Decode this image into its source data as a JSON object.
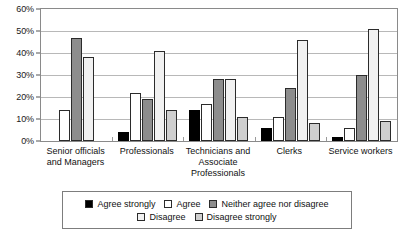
{
  "chart_data": {
    "type": "bar",
    "title": "",
    "subtitle": "",
    "xlabel": "",
    "ylabel": "",
    "ylim": [
      0,
      60
    ],
    "ytick_labels": [
      "0%",
      "10%",
      "20%",
      "30%",
      "40%",
      "50%",
      "60%"
    ],
    "ytick_values": [
      0,
      10,
      20,
      30,
      40,
      50,
      60
    ],
    "grid": true,
    "legend_position": "bottom",
    "categories": [
      "Senior officials and Managers",
      "Professionals",
      "Technicians and Associate Professionals",
      "Clerks",
      "Service workers"
    ],
    "series": [
      {
        "name": "Agree strongly",
        "color": "#000000",
        "values": [
          0,
          4,
          14,
          6,
          2
        ]
      },
      {
        "name": "Agree",
        "color": "#ffffff",
        "values": [
          14,
          22,
          17,
          11,
          6
        ]
      },
      {
        "name": "Neither agree nor disagree",
        "color": "#8d8d8d",
        "values": [
          47,
          19,
          28,
          24,
          30
        ]
      },
      {
        "name": "Disagree",
        "color": "#f1f1f1",
        "values": [
          38,
          41,
          28,
          46,
          51
        ]
      },
      {
        "name": "Disagree strongly",
        "color": "#cfcfcf",
        "values": [
          0,
          14,
          11,
          8,
          9
        ]
      }
    ]
  },
  "axis": {
    "y_ticks": [
      {
        "label": "60%",
        "value": 60
      },
      {
        "label": "50%",
        "value": 50
      },
      {
        "label": "40%",
        "value": 40
      },
      {
        "label": "30%",
        "value": 30
      },
      {
        "label": "20%",
        "value": 20
      },
      {
        "label": "10%",
        "value": 10
      },
      {
        "label": "0%",
        "value": 0
      }
    ],
    "x_labels": [
      "Senior officials and Managers",
      "Professionals",
      "Technicians and Associate Professionals",
      "Clerks",
      "Service workers"
    ]
  },
  "legend": {
    "rows": [
      [
        {
          "label": "Agree strongly",
          "swatch_name": "legend-swatch-agree-strongly",
          "class": "sw-agree-strongly"
        },
        {
          "label": "Agree",
          "swatch_name": "legend-swatch-agree",
          "class": "sw-agree"
        },
        {
          "label": "Neither agree nor disagree",
          "swatch_name": "legend-swatch-neither",
          "class": "sw-neither"
        }
      ],
      [
        {
          "label": "Disagree",
          "swatch_name": "legend-swatch-disagree",
          "class": "sw-disagree"
        },
        {
          "label": "Disagree strongly",
          "swatch_name": "legend-swatch-disagree-strongly",
          "class": "sw-disagree-strongly"
        }
      ]
    ]
  }
}
